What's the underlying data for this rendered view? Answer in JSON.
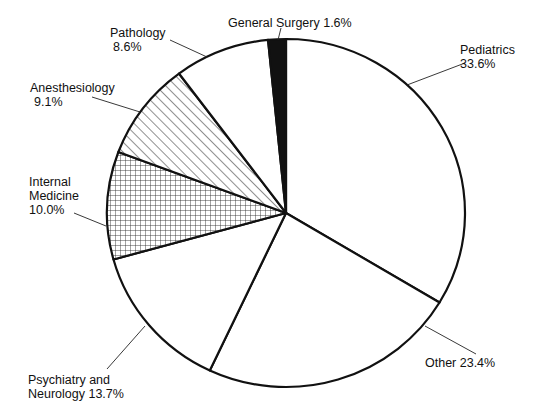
{
  "chart_data": {
    "type": "pie",
    "title": "",
    "start_angle_deg_clockwise_from_top": 0,
    "direction": "clockwise",
    "slices": [
      {
        "label": "Pediatrics",
        "value": 33.6,
        "display": "33.6%",
        "fill": "white"
      },
      {
        "label": "Other",
        "value": 23.4,
        "display": "23.4%",
        "fill": "white"
      },
      {
        "label": "Psychiatry and Neurology",
        "value": 13.7,
        "display": "13.7%",
        "fill": "white"
      },
      {
        "label": "Internal Medicine",
        "value": 10.0,
        "display": "10.0%",
        "fill": "crosshatch"
      },
      {
        "label": "Anesthesiology",
        "value": 9.1,
        "display": "9.1%",
        "fill": "diagonal-hatch"
      },
      {
        "label": "Pathology",
        "value": 8.6,
        "display": "8.6%",
        "fill": "white"
      },
      {
        "label": "General Surgery",
        "value": 1.6,
        "display": "1.6%",
        "fill": "black"
      }
    ],
    "legend": "none (direct labels with leader lines)"
  },
  "labels": {
    "pediatrics": {
      "line1": "Pediatrics",
      "line2": "33.6%"
    },
    "other": {
      "line1": "Other  23.4%"
    },
    "psychiatry": {
      "line1": "Psychiatry and",
      "line2": "Neurology 13.7%"
    },
    "internal_medicine": {
      "line1": "Internal",
      "line2": "Medicine",
      "line3": "10.0%"
    },
    "anesthesiology": {
      "line1": "Anesthesiology",
      "line2": "9.1%"
    },
    "pathology": {
      "line1": "Pathology",
      "line2": "8.6%"
    },
    "general_surgery": {
      "line1": "General Surgery  1.6%"
    }
  },
  "colors": {
    "stroke": "#111111",
    "background": "#ffffff",
    "solid": "#111111"
  }
}
